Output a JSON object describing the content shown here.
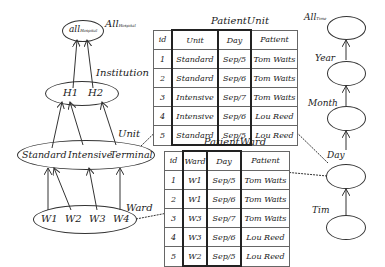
{
  "hospital_hierarchy": {
    "top_label": "All",
    "top_label_sub": "Hospital",
    "top_node": "all",
    "top_node_sub": "Hospital",
    "institution_label": "Institution",
    "institution_nodes": [
      "H1",
      "H2"
    ],
    "unit_label": "Unit",
    "unit_nodes": [
      "Standard",
      "Intensive",
      "Terminal"
    ],
    "ward_label": "Ward",
    "ward_nodes": [
      "W1",
      "W2",
      "W3",
      "W4"
    ]
  },
  "time_hierarchy": {
    "levels": [
      {
        "label": "All",
        "sub": "Time"
      },
      {
        "label": "Year"
      },
      {
        "label": "Month"
      },
      {
        "label": "Day"
      },
      {
        "label": "Tim"
      }
    ]
  },
  "patient_unit": {
    "title": "PatientUnit",
    "columns": [
      "id",
      "Unit",
      "Day",
      "Patient"
    ],
    "rows": [
      [
        "1",
        "Standard",
        "Sep/5",
        "Tom Waits"
      ],
      [
        "2",
        "Standard",
        "Sep/6",
        "Tom Waits"
      ],
      [
        "3",
        "Intensive",
        "Sep/7",
        "Tom Waits"
      ],
      [
        "4",
        "Intensive",
        "Sep/6",
        "Lou Reed"
      ],
      [
        "5",
        "Standard",
        "Sep/5",
        "Lou Reed"
      ]
    ]
  },
  "patient_ward": {
    "title": "PatientWard",
    "columns": [
      "id",
      "Ward",
      "Day",
      "Patient"
    ],
    "rows": [
      [
        "1",
        "W1",
        "Sep/5",
        "Tom Waits"
      ],
      [
        "2",
        "W1",
        "Sep/6",
        "Tom Waits"
      ],
      [
        "3",
        "W3",
        "Sep/7",
        "Tom Waits"
      ],
      [
        "4",
        "W3",
        "Sep/6",
        "Lou Reed"
      ],
      [
        "5",
        "W2",
        "Sep/5",
        "Lou Reed"
      ]
    ]
  }
}
